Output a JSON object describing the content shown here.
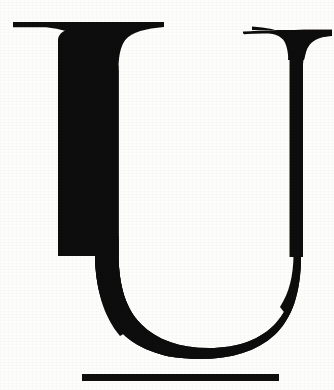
{
  "page": {
    "kind": "scanned-drop-cap",
    "width": 334,
    "height": 390,
    "background_color": "#fdfdfc",
    "ink_color": "#0d0c0a",
    "caption": ""
  },
  "glyph": {
    "character": "U",
    "name": "capital-letter-u",
    "style": "serif-didone-drop-cap",
    "label": "U",
    "ink_color": "#100f0d",
    "metrics": {
      "cap_top_y": 22,
      "baseline_y": 352,
      "left_serif_x1": 13,
      "left_serif_x2": 164,
      "right_serif_x1": 243,
      "right_serif_x2": 332,
      "left_stem_x1": 58,
      "left_stem_x2": 118,
      "left_stem_width": 60,
      "right_stem_x1": 289,
      "right_stem_x2": 303,
      "right_stem_width": 14,
      "counter_x1": 118,
      "counter_x2": 287,
      "counter_bottom_y": 340
    }
  },
  "rule": {
    "name": "horizontal-rule",
    "label": "",
    "x1": 82,
    "x2": 279,
    "y": 374,
    "thickness": 7,
    "color": "#110f0d"
  }
}
